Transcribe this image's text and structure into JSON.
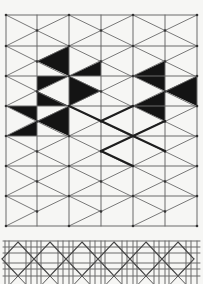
{
  "figure": {
    "width": 203,
    "height": 284,
    "background": "#f6f6f4",
    "line_color": "#6a6a6a",
    "bold_color": "#1e1e1e",
    "fill_color": "#141414"
  },
  "grid_panel": {
    "cols_x": [
      6,
      37,
      69,
      101,
      133,
      165,
      197
    ],
    "rows_y": [
      15,
      46,
      76,
      106,
      136,
      166,
      196,
      226
    ],
    "description": "square grid with diagonals connecting cell corners to mid-height points on alternate vertical lines",
    "black_triangles": [
      [
        [
          37,
          61
        ],
        [
          69,
          46
        ],
        [
          69,
          76
        ]
      ],
      [
        [
          69,
          76
        ],
        [
          101,
          61
        ],
        [
          101,
          76
        ]
      ],
      [
        [
          37,
          76
        ],
        [
          69,
          76
        ],
        [
          37,
          91
        ]
      ],
      [
        [
          37,
          91
        ],
        [
          69,
          106
        ],
        [
          37,
          106
        ]
      ],
      [
        [
          69,
          76
        ],
        [
          101,
          91
        ],
        [
          69,
          106
        ]
      ],
      [
        [
          6,
          106
        ],
        [
          37,
          106
        ],
        [
          37,
          121
        ]
      ],
      [
        [
          6,
          136
        ],
        [
          37,
          121
        ],
        [
          37,
          136
        ]
      ],
      [
        [
          37,
          121
        ],
        [
          69,
          106
        ],
        [
          69,
          136
        ]
      ],
      [
        [
          133,
          76
        ],
        [
          165,
          61
        ],
        [
          165,
          91
        ]
      ],
      [
        [
          165,
          91
        ],
        [
          197,
          76
        ],
        [
          197,
          106
        ]
      ],
      [
        [
          133,
          106
        ],
        [
          165,
          91
        ],
        [
          165,
          121
        ]
      ]
    ],
    "bold_segments": [
      [
        [
          69,
          106
        ],
        [
          101,
          121
        ]
      ],
      [
        [
          101,
          121
        ],
        [
          133,
          136
        ]
      ],
      [
        [
          133,
          136
        ],
        [
          165,
          151
        ]
      ],
      [
        [
          101,
          121
        ],
        [
          133,
          106
        ]
      ],
      [
        [
          133,
          136
        ],
        [
          165,
          121
        ]
      ],
      [
        [
          133,
          136
        ],
        [
          101,
          151
        ]
      ],
      [
        [
          101,
          151
        ],
        [
          133,
          166
        ]
      ]
    ]
  },
  "strip_panel": {
    "x_start": 3,
    "x_end": 200,
    "y_top": 241,
    "y_bottom": 284,
    "h_lines_y": [
      241,
      247,
      253,
      263,
      269,
      276
    ],
    "v_pairs_offsets": [
      5,
      9,
      26,
      31
    ],
    "period": 32,
    "diamond_centers_x": [
      18,
      50,
      82,
      114,
      146,
      178
    ],
    "diamond_center_y": 259,
    "diamond_half_width": 16,
    "diamond_half_height": 17
  }
}
